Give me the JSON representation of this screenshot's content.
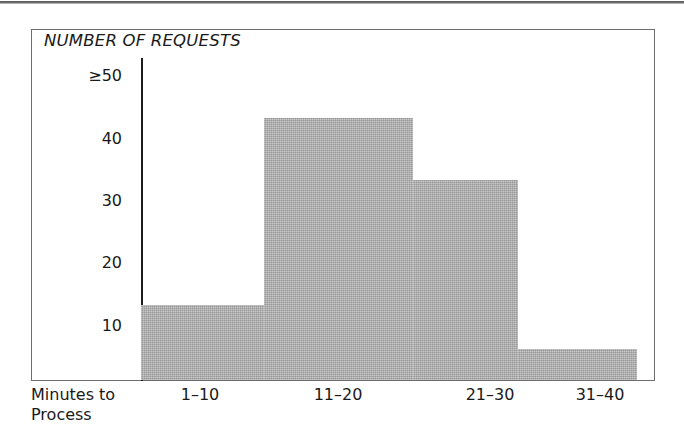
{
  "chart_data": {
    "type": "bar",
    "title": "NUMBER OF REQUESTS",
    "xlabel": "Minutes to Process",
    "ylabel": "NUMBER OF REQUESTS",
    "categories": [
      "1–10",
      "11–20",
      "21–30",
      "31–40"
    ],
    "values": [
      12,
      42,
      32,
      5
    ],
    "ylim": [
      0,
      50
    ],
    "yticks": [
      10,
      20,
      30,
      40,
      50
    ],
    "ytick_labels": [
      "10",
      "20",
      "30",
      "40",
      "≥50"
    ],
    "grid": false,
    "legend": false,
    "bar_color": "#a9a9a9",
    "axis_color": "#1c1c1c",
    "frame_color": "#6e6e6e"
  },
  "figure": {
    "title": "NUMBER OF REQUESTS",
    "y_axis": {
      "labels": [
        {
          "text": "≥50",
          "value": 50
        },
        {
          "text": "40",
          "value": 40
        },
        {
          "text": "30",
          "value": 30
        },
        {
          "text": "20",
          "value": 20
        },
        {
          "text": "10",
          "value": 10
        }
      ]
    },
    "x_axis": {
      "title_line1": "Minutes to",
      "title_line2": "Process",
      "labels": [
        "1–10",
        "11–20",
        "21–30",
        "31–40"
      ]
    },
    "bars": [
      {
        "category": "1–10",
        "value": 12
      },
      {
        "category": "11–20",
        "value": 42
      },
      {
        "category": "21–30",
        "value": 32
      },
      {
        "category": "31–40",
        "value": 5
      }
    ]
  }
}
